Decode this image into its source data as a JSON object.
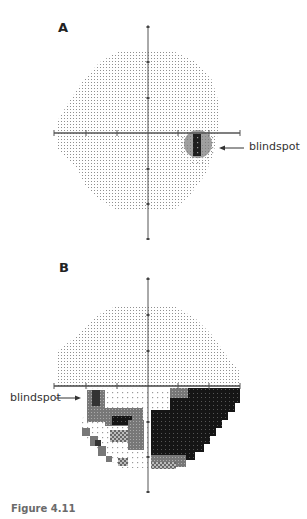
{
  "figure": {
    "caption": "Figure 4.11",
    "panels": [
      {
        "label": "A",
        "annotation": "blindspot",
        "description": "Normal visual field plot with physiological blindspot in temporal field just below horizontal meridian"
      },
      {
        "label": "B",
        "annotation": "blindspot",
        "description": "Visual field plot with dense inferior field defect (darker shading = reduced sensitivity), more severe in right inferior quadrant"
      }
    ]
  },
  "colors": {
    "dot_light": "#8a8a8a",
    "dense": "#1a1a1a",
    "mid": "#6b6b6b",
    "axis": "#555555"
  }
}
